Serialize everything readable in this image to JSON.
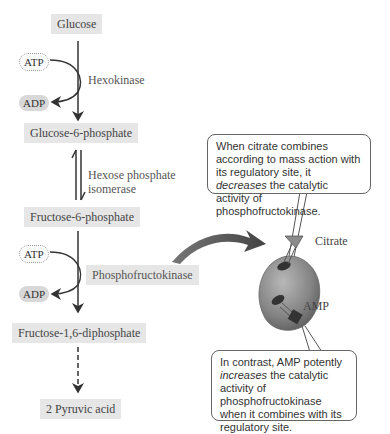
{
  "pathway": {
    "glucose": "Glucose",
    "g6p": "Glucose-6-phosphate",
    "f6p": "Fructose-6-phosphate",
    "f16bp": "Fructose-1,6-diphosphate",
    "pyruvate": "2 Pyruvic acid"
  },
  "enzymes": {
    "hexokinase": "Hexokinase",
    "isomerase_line1": "Hexose phosphate",
    "isomerase_line2": "isomerase",
    "pfk": "Phosphofructokinase"
  },
  "cofactors": {
    "atp1": "ATP",
    "adp1": "ADP",
    "atp2": "ATP",
    "adp2": "ADP"
  },
  "regulators": {
    "citrate": "Citrate",
    "amp": "AMP"
  },
  "callouts": {
    "citrate": {
      "pre": "When citrate combines according to mass action with its regulatory site, it ",
      "emph": "decreases",
      "post": " the catalytic activity of phosphofructokinase."
    },
    "amp": {
      "pre": "In contrast, AMP potently ",
      "emph": "increases",
      "post": " the catalytic activity of phosphofructokinase when it combines with its regulatory site."
    }
  },
  "colors": {
    "box_bg": "#e6e6e6",
    "arrow": "#333333",
    "enzyme_body": "#8a8a8a",
    "citrate_cone": "#8c8c8c",
    "amp_block": "#333333"
  }
}
